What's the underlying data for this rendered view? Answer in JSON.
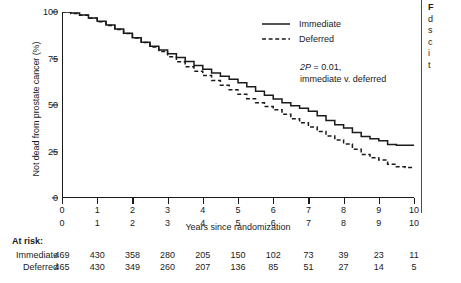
{
  "chart_data": {
    "type": "line",
    "title": "",
    "xlabel": "Years since randomization",
    "ylabel": "Not dead from prostate cancer (%)",
    "xlim": [
      0,
      10
    ],
    "ylim": [
      0,
      100
    ],
    "xticks": [
      "0",
      "1",
      "2",
      "3",
      "4",
      "5",
      "6",
      "7",
      "8",
      "9",
      "10"
    ],
    "yticks": [
      "0",
      "25",
      "50",
      "75",
      "100"
    ],
    "grid": false,
    "legend_position": "top-right",
    "annotation": {
      "line1_prefix": "2P",
      "line1_rest": " = 0.01,",
      "line2": "immediate v. deferred"
    },
    "series": [
      {
        "name": "Immediate",
        "style": "solid",
        "x": [
          0,
          0.25,
          0.5,
          0.75,
          1.0,
          1.25,
          1.5,
          1.75,
          2.0,
          2.25,
          2.5,
          2.75,
          3.0,
          3.25,
          3.5,
          3.75,
          4.0,
          4.25,
          4.5,
          4.75,
          5.0,
          5.25,
          5.5,
          5.75,
          6.0,
          6.25,
          6.5,
          6.75,
          7.0,
          7.25,
          7.5,
          7.75,
          8.0,
          8.25,
          8.5,
          8.75,
          9.0,
          9.25,
          9.5,
          9.75,
          10.0
        ],
        "y": [
          100,
          99.4,
          98.4,
          96.8,
          95.0,
          93.0,
          90.8,
          88.6,
          86.2,
          83.8,
          81.6,
          79.6,
          77.6,
          75.6,
          73.4,
          71.2,
          69.2,
          67.2,
          65.4,
          63.8,
          62.0,
          59.8,
          57.4,
          55.2,
          53.2,
          51.2,
          49.6,
          48.2,
          46.6,
          44.2,
          41.6,
          39.4,
          37.6,
          35.2,
          33.0,
          31.8,
          30.8,
          28.8,
          28.4,
          28.4,
          28.4
        ]
      },
      {
        "name": "Deferred",
        "style": "dashed",
        "x": [
          0,
          0.25,
          0.5,
          0.75,
          1.0,
          1.25,
          1.5,
          1.75,
          2.0,
          2.25,
          2.5,
          2.75,
          3.0,
          3.25,
          3.5,
          3.75,
          4.0,
          4.25,
          4.5,
          4.75,
          5.0,
          5.25,
          5.5,
          5.75,
          6.0,
          6.25,
          6.5,
          6.75,
          7.0,
          7.25,
          7.5,
          7.75,
          8.0,
          8.25,
          8.5,
          8.75,
          9.0,
          9.25,
          9.5,
          9.75,
          10.0
        ],
        "y": [
          100,
          99.2,
          98.2,
          96.6,
          94.8,
          92.8,
          90.6,
          88.4,
          86.0,
          83.6,
          81.2,
          78.8,
          76.0,
          73.2,
          70.6,
          68.2,
          65.8,
          63.2,
          60.6,
          58.2,
          55.8,
          53.4,
          51.2,
          49.2,
          47.4,
          45.0,
          42.6,
          40.4,
          38.2,
          35.8,
          33.4,
          31.2,
          29.0,
          26.2,
          23.4,
          21.6,
          20.4,
          18.2,
          16.8,
          16.4,
          16.2
        ]
      }
    ]
  },
  "legend": {
    "items": [
      {
        "label": "Immediate",
        "style": "solid"
      },
      {
        "label": "Deferred",
        "style": "dashed"
      }
    ]
  },
  "at_risk": {
    "title": "At risk:",
    "columns": [
      "0",
      "1",
      "2",
      "3",
      "4",
      "5",
      "6",
      "7",
      "8",
      "9",
      "10"
    ],
    "rows": [
      {
        "label": "Immediate",
        "values": [
          "469",
          "430",
          "358",
          "280",
          "205",
          "150",
          "102",
          "73",
          "39",
          "23",
          "11"
        ]
      },
      {
        "label": "Deferred",
        "values": [
          "465",
          "430",
          "349",
          "260",
          "207",
          "136",
          "85",
          "51",
          "27",
          "14",
          "5"
        ]
      }
    ]
  },
  "caption": {
    "lead": "F",
    "lines": [
      "d",
      "s",
      "c",
      "i",
      "t"
    ]
  }
}
